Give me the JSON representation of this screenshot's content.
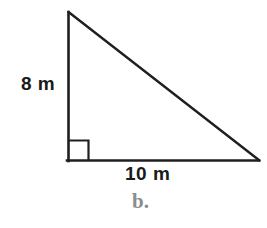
{
  "figure": {
    "title_label": "b.",
    "shape": "right-triangle",
    "stroke_color": "#1f1f1f",
    "background_color": "#ffffff",
    "label_color": "#1a1a1a",
    "part_label_color": "#8c8c8c",
    "labels": {
      "vertical_leg": "8 m",
      "horizontal_leg": "10 m"
    },
    "geometry": {
      "apex": [
        68,
        12
      ],
      "right_angle_vertex": [
        68,
        161
      ],
      "right_vertex": [
        259,
        161
      ],
      "right_angle_marker_size": 20
    },
    "measurements": {
      "vertical_leg_value": 8,
      "vertical_leg_unit": "m",
      "horizontal_leg_value": 10,
      "horizontal_leg_unit": "m"
    }
  }
}
